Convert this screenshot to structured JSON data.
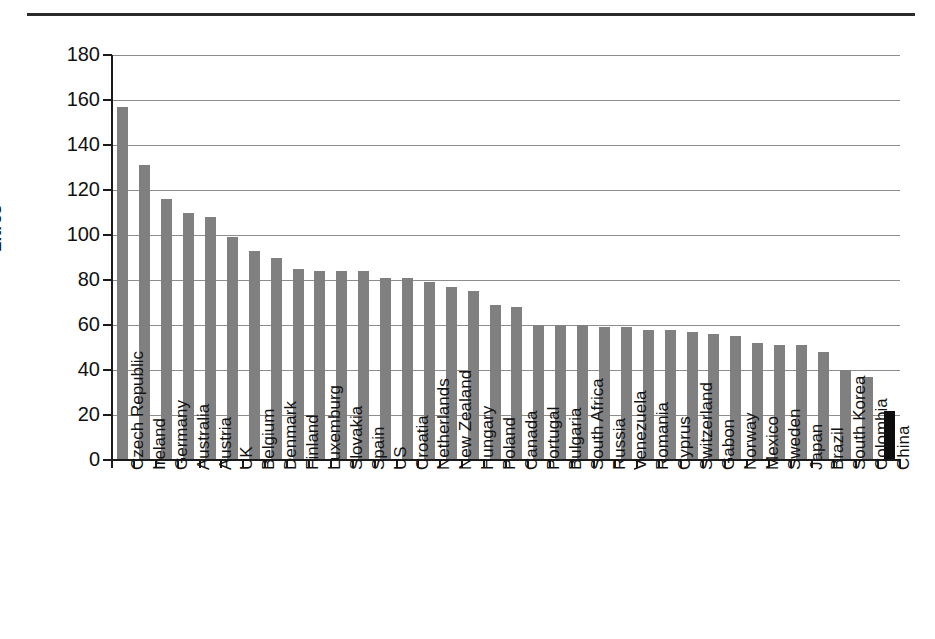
{
  "chart_data": {
    "type": "bar",
    "title": "",
    "xlabel": "",
    "ylabel": "Litres",
    "ylim": [
      0,
      180
    ],
    "ytick_step": 20,
    "yticks": [
      "0",
      "20",
      "40",
      "60",
      "80",
      "100",
      "120",
      "140",
      "160",
      "180"
    ],
    "grid": true,
    "legend": "none",
    "bar_color": "#808080",
    "highlight_color": "#0d0d0d",
    "highlight_category": "China",
    "categories": [
      "Czech Republic",
      "Ireland",
      "Germany",
      "Australia",
      "Austria",
      "UK",
      "Belgium",
      "Denmark",
      "Finland",
      "Luxemburg",
      "Slovakia",
      "Spain",
      "US",
      "Croatia",
      "Netherlands",
      "New Zealand",
      "Hungary",
      "Poland",
      "Canada",
      "Portugal",
      "Bulgaria",
      "South Africa",
      "Russia",
      "Venezuela",
      "Romania",
      "Cyprus",
      "Switzerland",
      "Gabon",
      "Norway",
      "Mexico",
      "Sweden",
      "Japan",
      "Brazil",
      "South Korea",
      "Colombia",
      "China"
    ],
    "values": [
      157,
      131,
      116,
      110,
      108,
      99,
      93,
      90,
      85,
      84,
      84,
      84,
      81,
      81,
      79,
      77,
      75,
      69,
      68,
      60,
      60,
      60,
      59,
      59,
      58,
      58,
      57,
      56,
      55,
      52,
      51,
      51,
      48,
      40,
      37,
      22
    ]
  },
  "axis": {
    "y_title": "Litres"
  }
}
